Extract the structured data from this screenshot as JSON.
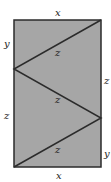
{
  "diagram": {
    "colors": {
      "fill": "#a6a6a6",
      "stroke": "#2b2b2b",
      "text": "#222222"
    },
    "rectangle": {
      "left": 14,
      "top": 20,
      "right": 101,
      "bottom": 167
    },
    "zigzag": [
      [
        101,
        20
      ],
      [
        14,
        69
      ],
      [
        101,
        118
      ],
      [
        14,
        167
      ]
    ],
    "outer_labels": {
      "top": "x",
      "bottom": "x",
      "left_upper": "y",
      "left_lower": "z",
      "right_upper": "z",
      "right_lower": "y"
    },
    "segment_labels": [
      "z",
      "z",
      "z"
    ]
  }
}
